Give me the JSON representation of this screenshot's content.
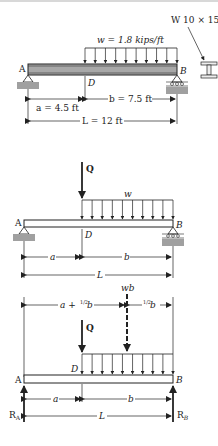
{
  "figure1": {
    "section_label": "W 10 × 15",
    "load_label": "w = 1.8 kips/ft",
    "point_A": "A",
    "point_B": "B",
    "point_D": "D",
    "dim_a": "a = 4.5 ft",
    "dim_b": "b = 7.5 ft",
    "dim_L": "L = 12 ft",
    "colors": {
      "beam": "#a8a8a8",
      "support": "#a0a0a0",
      "line": "#222222"
    }
  },
  "figure2": {
    "point_load": "Q",
    "dist_load": "w",
    "point_A": "A",
    "point_B": "B",
    "point_D": "D",
    "dim_a": "a",
    "dim_b": "b",
    "dim_L": "L"
  },
  "figure3": {
    "resultant_label": "wb",
    "dim_left_prefix": "a + ",
    "dim_left_frac": "1/2",
    "dim_left_suffix": "b",
    "dim_right_frac": "1/2",
    "dim_right_suffix": "b",
    "point_load": "Q",
    "point_A": "A",
    "point_B": "B",
    "point_D": "D",
    "dim_a": "a",
    "dim_b": "b",
    "dim_L": "L",
    "reaction_A": "R",
    "reaction_A_sub": "A",
    "reaction_B": "R",
    "reaction_B_sub": "B"
  }
}
